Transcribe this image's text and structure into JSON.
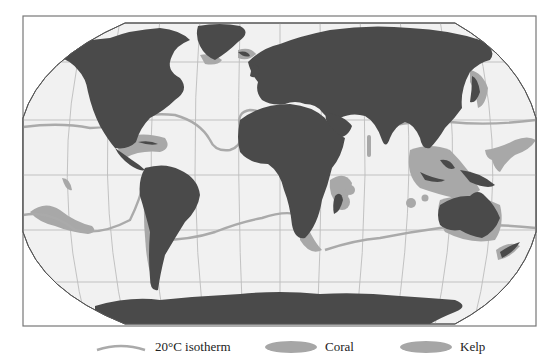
{
  "map": {
    "type": "world map",
    "projection": "Robinson-like",
    "colors": {
      "ocean": "#f1f1f1",
      "land": "#4a4a4a",
      "graticule": "#b9b9b9",
      "isotherm": "#aaaaaa",
      "coral": "#a6a6a6",
      "kelp": "#a6a6a6",
      "frame": "#777777"
    }
  },
  "legend": {
    "items": [
      {
        "label": "20°C isotherm",
        "symbol": "line",
        "color": "#aaaaaa"
      },
      {
        "label": "Coral",
        "symbol": "ellipse",
        "color": "#a6a6a6"
      },
      {
        "label": "Kelp",
        "symbol": "ellipse",
        "color": "#a6a6a6"
      }
    ]
  }
}
